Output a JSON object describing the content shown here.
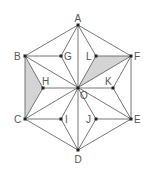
{
  "diagram": {
    "title": "",
    "colors": {
      "line": "#666666",
      "shade": "#d4d4d4",
      "point": "#222222",
      "label": "#555555"
    },
    "points": {
      "A": {
        "x": 78,
        "y": 25,
        "label": "A"
      },
      "B": {
        "x": 25,
        "y": 56,
        "label": "B"
      },
      "C": {
        "x": 25,
        "y": 119,
        "label": "C"
      },
      "D": {
        "x": 78,
        "y": 150,
        "label": "D"
      },
      "E": {
        "x": 131,
        "y": 119,
        "label": "E"
      },
      "F": {
        "x": 131,
        "y": 56,
        "label": "F"
      },
      "O": {
        "x": 78,
        "y": 88,
        "label": "O"
      },
      "G": {
        "x": 61,
        "y": 56,
        "label": "G"
      },
      "H": {
        "x": 43,
        "y": 88,
        "label": "H"
      },
      "I": {
        "x": 61,
        "y": 119,
        "label": "I"
      },
      "J": {
        "x": 96,
        "y": 119,
        "label": "J"
      },
      "K": {
        "x": 113,
        "y": 88,
        "label": "K"
      },
      "L": {
        "x": 96,
        "y": 56,
        "label": "L"
      }
    },
    "shaded_regions": [
      [
        "B",
        "H",
        "C"
      ],
      [
        "L",
        "F",
        "O"
      ]
    ],
    "labels": [
      "A",
      "B",
      "C",
      "D",
      "E",
      "F",
      "G",
      "H",
      "I",
      "J",
      "K",
      "L",
      "O"
    ]
  }
}
